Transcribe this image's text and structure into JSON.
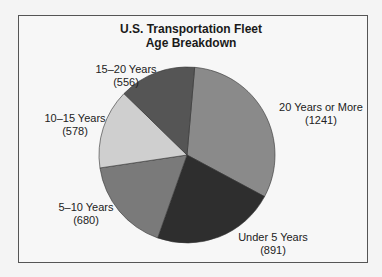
{
  "chart_data": {
    "type": "pie",
    "title": "U.S. Transportation Fleet Age Breakdown",
    "title_lines": [
      "U.S. Transportation Fleet",
      "Age Breakdown"
    ],
    "start_angle_deg": 5,
    "direction": "clockwise",
    "categories": [
      "20 Years or More",
      "Under 5 Years",
      "5–10 Years",
      "10–15 Years",
      "15–20 Years"
    ],
    "values": [
      1241,
      891,
      680,
      578,
      556
    ],
    "value_labels": [
      "(1241)",
      "(891)",
      "(680)",
      "(578)",
      "(556)"
    ],
    "colors": [
      "#8a8a8a",
      "#2e2e2e",
      "#7a7a7a",
      "#cfcfcf",
      "#555555"
    ],
    "legend": "none (labels placed beside slices)"
  }
}
